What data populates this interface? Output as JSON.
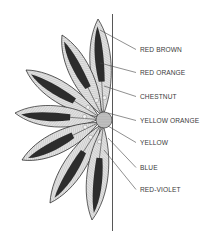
{
  "figure": {
    "type": "flower-petal-color-diagram",
    "hub": {
      "cx": 104,
      "cy": 120,
      "r": 8
    },
    "divider_line": {
      "x": 112.5,
      "y1": 14,
      "y2": 231
    },
    "colors": {
      "background": "#ffffff",
      "ink": "#2a2a2a",
      "petal_fill": "#e4e4e4",
      "petal_stripe": "#1a1a1a",
      "label_text": "#3a3a3a"
    },
    "petals": [
      {
        "tip_x": 98,
        "tip_y": 19
      },
      {
        "tip_x": 62,
        "tip_y": 35
      },
      {
        "tip_x": 26,
        "tip_y": 70
      },
      {
        "tip_x": 15,
        "tip_y": 113
      },
      {
        "tip_x": 22,
        "tip_y": 160
      },
      {
        "tip_x": 50,
        "tip_y": 203
      },
      {
        "tip_x": 92,
        "tip_y": 220
      }
    ],
    "labels": [
      {
        "text": "RED BROWN",
        "x": 140,
        "y": 46,
        "line_from": [
          100,
          30
        ]
      },
      {
        "text": "RED ORANGE",
        "x": 140,
        "y": 69,
        "line_from": [
          100,
          63
        ]
      },
      {
        "text": "CHESTNUT",
        "x": 140,
        "y": 93,
        "line_from": [
          104,
          86
        ]
      },
      {
        "text": "YELLOW ORANGE",
        "x": 140,
        "y": 117,
        "line_from": [
          108,
          113
        ]
      },
      {
        "text": "YELLOW",
        "x": 140,
        "y": 139,
        "line_from": [
          108,
          126
        ]
      },
      {
        "text": "BLUE",
        "x": 140,
        "y": 164,
        "line_from": [
          108,
          138
        ]
      },
      {
        "text": "RED-VIOLET",
        "x": 140,
        "y": 186,
        "line_from": [
          104,
          150
        ]
      }
    ]
  }
}
